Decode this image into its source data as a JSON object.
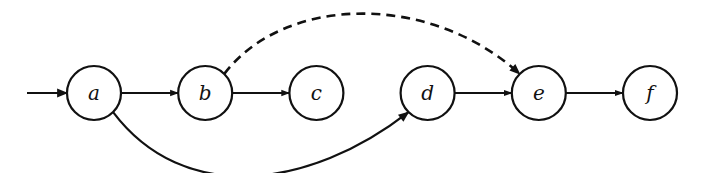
{
  "diagram": {
    "type": "state-graph",
    "nodes": [
      {
        "id": "a",
        "label": "a",
        "initial": true
      },
      {
        "id": "b",
        "label": "b"
      },
      {
        "id": "c",
        "label": "c"
      },
      {
        "id": "d",
        "label": "d"
      },
      {
        "id": "e",
        "label": "e"
      },
      {
        "id": "f",
        "label": "f"
      }
    ],
    "edges": [
      {
        "from": "a",
        "to": "b",
        "style": "solid"
      },
      {
        "from": "b",
        "to": "c",
        "style": "solid"
      },
      {
        "from": "d",
        "to": "e",
        "style": "solid"
      },
      {
        "from": "e",
        "to": "f",
        "style": "solid"
      },
      {
        "from": "b",
        "to": "e",
        "style": "dashed",
        "curve": "above"
      },
      {
        "from": "a",
        "to": "d",
        "style": "solid",
        "curve": "below"
      }
    ],
    "colors": {
      "stroke": "#111111",
      "background": "#ffffff"
    }
  }
}
